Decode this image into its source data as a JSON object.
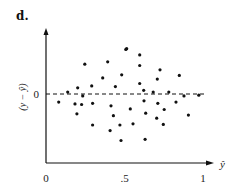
{
  "panel_label": "d.",
  "chart_data": {
    "type": "scatter",
    "title": "",
    "xlabel": "ŷ",
    "ylabel": "(y − ŷ)",
    "xlim": [
      0,
      1.05
    ],
    "x_ticks": [
      {
        "value": 0,
        "label": "0"
      },
      {
        "value": 0.5,
        "label": ".5"
      },
      {
        "value": 1,
        "label": "1"
      }
    ],
    "y_ticks": [
      {
        "value": 0,
        "label": "0"
      }
    ],
    "reference_line": {
      "y": 0,
      "style": "dashed"
    },
    "grid": false,
    "legend": null,
    "points": [
      {
        "x": 0.247,
        "y": 0.48
      },
      {
        "x": 0.393,
        "y": 0.52
      },
      {
        "x": 0.508,
        "y": 0.72
      },
      {
        "x": 0.482,
        "y": 0.31
      },
      {
        "x": 0.361,
        "y": 0.26
      },
      {
        "x": 0.291,
        "y": 0.13
      },
      {
        "x": 0.202,
        "y": 0.1
      },
      {
        "x": 0.442,
        "y": 0.12
      },
      {
        "x": 0.138,
        "y": 0.03
      },
      {
        "x": 0.234,
        "y": -0.03
      },
      {
        "x": 0.081,
        "y": -0.13
      },
      {
        "x": 0.185,
        "y": -0.16
      },
      {
        "x": 0.227,
        "y": -0.17
      },
      {
        "x": 0.297,
        "y": -0.15
      },
      {
        "x": 0.414,
        "y": -0.19
      },
      {
        "x": 0.197,
        "y": -0.32
      },
      {
        "x": 0.429,
        "y": -0.35
      },
      {
        "x": 0.297,
        "y": -0.5
      },
      {
        "x": 0.408,
        "y": -0.59
      },
      {
        "x": 0.471,
        "y": -0.5
      },
      {
        "x": 0.478,
        "y": -0.75
      },
      {
        "x": 0.514,
        "y": 0.73
      },
      {
        "x": 0.597,
        "y": 0.63
      },
      {
        "x": 0.597,
        "y": 0.46
      },
      {
        "x": 0.726,
        "y": 0.39
      },
      {
        "x": 0.849,
        "y": 0.3
      },
      {
        "x": 0.709,
        "y": 0.24
      },
      {
        "x": 0.597,
        "y": 0.17
      },
      {
        "x": 0.622,
        "y": 0.06
      },
      {
        "x": 0.683,
        "y": 0.03
      },
      {
        "x": 0.782,
        "y": 0.03
      },
      {
        "x": 0.879,
        "y": -0.03
      },
      {
        "x": 0.973,
        "y": -0.02
      },
      {
        "x": 0.624,
        "y": -0.11
      },
      {
        "x": 0.828,
        "y": -0.13
      },
      {
        "x": 0.712,
        "y": -0.15
      },
      {
        "x": 0.537,
        "y": -0.24
      },
      {
        "x": 0.753,
        "y": -0.25
      },
      {
        "x": 0.635,
        "y": -0.31
      },
      {
        "x": 0.907,
        "y": -0.34
      },
      {
        "x": 0.705,
        "y": -0.39
      },
      {
        "x": 0.554,
        "y": -0.48
      },
      {
        "x": 0.747,
        "y": -0.49
      },
      {
        "x": 0.631,
        "y": -0.73
      }
    ]
  }
}
